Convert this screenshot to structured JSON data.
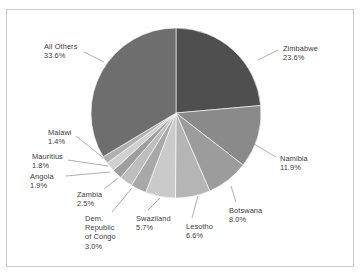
{
  "chart_data": {
    "type": "pie",
    "title": "",
    "subtitle": "",
    "xlabel": "",
    "ylabel": "",
    "legend_position": "none",
    "grid": false,
    "units": "percent",
    "start_angle_deg": 0,
    "direction": "clockwise",
    "categories": [
      "Zimbabwe",
      "Namibia",
      "Botswana",
      "Lesotho",
      "Swaziland",
      "Dem. Republic of Congo",
      "Zambia",
      "Angola",
      "Mauritius",
      "Malawi",
      "All Others"
    ],
    "values": [
      23.6,
      11.9,
      8.0,
      6.6,
      5.7,
      3.0,
      2.5,
      1.9,
      1.8,
      1.4,
      33.6
    ],
    "colors": [
      "#4f4f4f",
      "#8a8a8a",
      "#9c9c9c",
      "#b5b5b5",
      "#cacaca",
      "#a8a8a8",
      "#bebebe",
      "#9e9e9e",
      "#d0d0d0",
      "#b0b0b0",
      "#6e6e6e"
    ],
    "slices": [
      {
        "label": "Zimbabwe",
        "value_text": "23.6%",
        "value": 23.6,
        "color": "#4f4f4f",
        "label_x": 283,
        "label_y": 44,
        "align": "left",
        "leader": [
          258,
          60,
          278,
          50
        ]
      },
      {
        "label": "Namibia",
        "value_text": "11.9%",
        "value": 11.9,
        "color": "#8a8a8a",
        "label_x": 280,
        "label_y": 154,
        "align": "left",
        "leader": [
          254,
          144,
          276,
          157
        ]
      },
      {
        "label": "Botswana",
        "value_text": "8.0%",
        "value": 8.0,
        "color": "#9c9c9c",
        "label_x": 229,
        "label_y": 206,
        "align": "left",
        "leader": [
          231,
          186,
          236,
          202
        ]
      },
      {
        "label": "Lesotho",
        "value_text": "6.6%",
        "value": 6.6,
        "color": "#b5b5b5",
        "label_x": 186,
        "label_y": 222,
        "align": "left",
        "leader": [
          198,
          196,
          192,
          218
        ]
      },
      {
        "label": "Swaziland",
        "value_text": "5.7%",
        "value": 5.7,
        "color": "#cacaca",
        "label_x": 136,
        "label_y": 214,
        "align": "left",
        "leader": [
          160,
          198,
          148,
          210
        ]
      },
      {
        "label": "Dem.\nRepublic\nof Congo",
        "value_text": "3.0%",
        "value": 3.0,
        "color": "#a8a8a8",
        "label_x": 85,
        "label_y": 214,
        "align": "left",
        "leader": [
          132,
          188,
          112,
          212
        ]
      },
      {
        "label": "Zambia",
        "value_text": "2.5%",
        "value": 2.5,
        "color": "#bebebe",
        "label_x": 77,
        "label_y": 190,
        "align": "left",
        "leader": [
          118,
          178,
          104,
          189
        ]
      },
      {
        "label": "Angola",
        "value_text": "1.9%",
        "value": 1.9,
        "color": "#9e9e9e",
        "label_x": 30,
        "label_y": 172,
        "align": "left",
        "leader": [
          110,
          172,
          66,
          176
        ]
      },
      {
        "label": "Mauritius",
        "value_text": "1.8%",
        "value": 1.8,
        "color": "#d0d0d0",
        "label_x": 32,
        "label_y": 152,
        "align": "left",
        "leader": [
          108,
          166,
          68,
          160
        ]
      },
      {
        "label": "Malawi",
        "value_text": "1.4%",
        "value": 1.4,
        "color": "#b0b0b0",
        "label_x": 48,
        "label_y": 128,
        "align": "left",
        "leader": [
          106,
          160,
          76,
          136
        ]
      },
      {
        "label": "All Others",
        "value_text": "33.6%",
        "value": 33.6,
        "color": "#6e6e6e",
        "label_x": 44,
        "label_y": 42,
        "align": "left",
        "leader": [
          104,
          62,
          84,
          52
        ]
      }
    ],
    "geometry": {
      "center_x": 176,
      "center_y": 113,
      "radius": 85
    }
  },
  "frame": {
    "border_color": "#c9c9c9",
    "background": "#ffffff"
  }
}
